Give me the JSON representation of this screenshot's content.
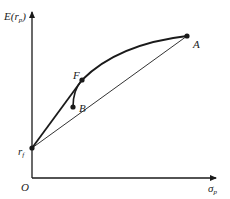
{
  "diagram": {
    "axes": {
      "y_label_main": "E(r",
      "y_label_sub": "p",
      "y_label_close": ")",
      "x_label_main": "σ",
      "x_label_sub": "p",
      "origin_label": "O"
    },
    "points": {
      "rf": {
        "label": "r",
        "sub": "f"
      },
      "F": {
        "label": "F"
      },
      "B": {
        "label": "B"
      },
      "A": {
        "label": "A"
      }
    },
    "colors": {
      "ink": "#1a1a1a",
      "thin_line": "#333333"
    }
  }
}
